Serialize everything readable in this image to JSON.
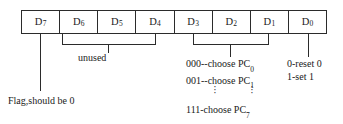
{
  "diagram": {
    "register": {
      "cells": [
        {
          "name": "D7",
          "base": "D",
          "sub": "7"
        },
        {
          "name": "D6",
          "base": "D",
          "sub": "6"
        },
        {
          "name": "D5",
          "base": "D",
          "sub": "5"
        },
        {
          "name": "D4",
          "base": "D",
          "sub": "4"
        },
        {
          "name": "D3",
          "base": "D",
          "sub": "3"
        },
        {
          "name": "D2",
          "base": "D",
          "sub": "2"
        },
        {
          "name": "D1",
          "base": "D",
          "sub": "1"
        },
        {
          "name": "D0",
          "base": "D",
          "sub": "0"
        }
      ]
    },
    "annotations": {
      "unused": "unused",
      "flag": "Flag,should be 0",
      "pc_select": {
        "line1_text": "000--choose PC",
        "line1_sub": "0",
        "line2_text": "001--choose PC",
        "line2_sub": "1",
        "ellipsis": "⋮",
        "line_last_text": "111-choose PC",
        "line_last_sub": "7"
      },
      "d0_meaning": {
        "line1": "0-reset 0",
        "line2": "1-set 1"
      }
    },
    "colors": {
      "stroke": "#2b2b2b",
      "text": "#1a1a1a",
      "background": "#ffffff"
    }
  }
}
